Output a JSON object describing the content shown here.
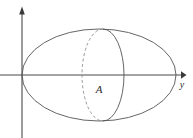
{
  "figure": {
    "kind": "3d-solid-of-revolution-diagram",
    "background_color": "#ffffff",
    "width": 193,
    "height": 138,
    "axes": {
      "stroke_color": "#4a4a4a",
      "arrow_fill": "#3a3a3a",
      "origin": {
        "x": 22,
        "y": 75
      },
      "vertical": {
        "name": "vertical-axis",
        "x": 22,
        "top_y": 8,
        "bottom_y": 138,
        "has_arrow_head": true,
        "arrow_at": "top",
        "label": ""
      },
      "horizontal": {
        "name": "horizontal-axis",
        "y": 75,
        "left_x": 0,
        "right_x": 185,
        "has_arrow_head": true,
        "arrow_at": "right",
        "label": "y",
        "label_x": 183,
        "label_y": 88
      }
    },
    "shapes": [
      {
        "name": "outer-ellipse",
        "role": "solid-of-revolution-outline",
        "type": "ellipse",
        "center_x": 99,
        "center_y": 75,
        "radius_x": 77,
        "radius_y": 46,
        "stroke": "#555555",
        "stroke_width": 0.9,
        "style": "solid",
        "fill": "none"
      },
      {
        "name": "cross-section-ellipse-front",
        "role": "cross-section-visible-half",
        "type": "ellipse-arc",
        "center_x": 103,
        "center_y": 75,
        "radius_x": 21,
        "radius_y": 46,
        "half": "right",
        "stroke": "#555555",
        "stroke_width": 0.9,
        "style": "solid"
      },
      {
        "name": "cross-section-ellipse-back",
        "role": "cross-section-hidden-half",
        "type": "ellipse-arc",
        "center_x": 103,
        "center_y": 75,
        "radius_x": 21,
        "radius_y": 46,
        "half": "left",
        "stroke": "#8d8d8d",
        "stroke_width": 0.9,
        "style": "dashed",
        "dash_pattern": "3 2.4"
      }
    ],
    "labels": [
      {
        "name": "cross-section-area-label",
        "text": "A",
        "x": 99,
        "y": 93,
        "font_style": "italic",
        "font_size": 11,
        "color": "#2b2b2b"
      },
      {
        "name": "axis-label-y",
        "text": "y",
        "x": 182,
        "y": 88,
        "font_style": "italic",
        "font_size": 10,
        "color": "#2b2b2b"
      }
    ]
  }
}
